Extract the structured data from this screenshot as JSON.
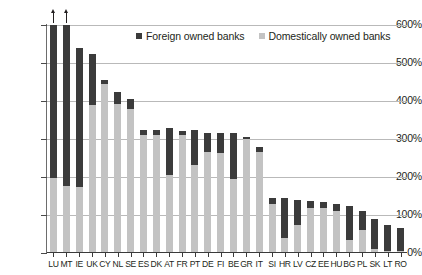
{
  "chart_data": {
    "type": "bar",
    "stacked": true,
    "title": "",
    "subtitle": "",
    "xlabel": "",
    "ylabel": "",
    "ylim": [
      0,
      600
    ],
    "ytick_labels": [
      "600%",
      "500%",
      "400%",
      "300%",
      "200%",
      "100%",
      "0%"
    ],
    "ytick_values": [
      600,
      500,
      400,
      300,
      200,
      100,
      0
    ],
    "grid": true,
    "legend_position": "top-center",
    "categories": [
      "LU",
      "MT",
      "IE",
      "UK",
      "CY",
      "NL",
      "SE",
      "ES",
      "DK",
      "AT",
      "FR",
      "PT",
      "DE",
      "FI",
      "BE",
      "GR",
      "IT",
      "SI",
      "HR",
      "LV",
      "CZ",
      "EE",
      "HU",
      "BG",
      "PL",
      "SK",
      "LT",
      "RO"
    ],
    "series": [
      {
        "name": "Domestically owned banks",
        "color": "#c3c3c3",
        "values": [
          198,
          177,
          174,
          390,
          445,
          392,
          380,
          310,
          310,
          205,
          310,
          232,
          265,
          262,
          195,
          300,
          265,
          130,
          40,
          75,
          118,
          118,
          110,
          35,
          60,
          10,
          5,
          5
        ]
      },
      {
        "name": "Foreign owned banks",
        "color": "#3b3b3b",
        "values": [
          402,
          423,
          366,
          135,
          10,
          33,
          25,
          15,
          15,
          125,
          10,
          92,
          50,
          53,
          120,
          5,
          15,
          15,
          105,
          65,
          20,
          17,
          20,
          90,
          50,
          80,
          70,
          60
        ]
      }
    ],
    "totals": [
      600,
      600,
      540,
      525,
      455,
      425,
      405,
      325,
      325,
      330,
      320,
      324,
      315,
      315,
      315,
      305,
      280,
      145,
      145,
      140,
      138,
      135,
      130,
      125,
      110,
      90,
      75,
      65
    ],
    "exceeds_axis": [
      "LU",
      "MT"
    ],
    "annotations": [
      {
        "label": "value exceeds axis maximum",
        "category": "LU",
        "marker": "up-arrow"
      },
      {
        "label": "value exceeds axis maximum",
        "category": "MT",
        "marker": "up-arrow"
      }
    ]
  },
  "legend": {
    "items": [
      {
        "label": "Foreign owned banks",
        "color": "#3b3b3b"
      },
      {
        "label": "Domestically owned banks",
        "color": "#c3c3c3"
      }
    ]
  }
}
